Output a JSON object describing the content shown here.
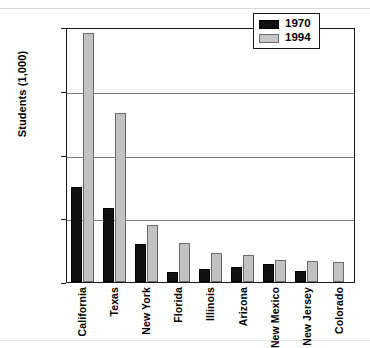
{
  "chart_data": {
    "type": "bar",
    "title": "",
    "xlabel": "",
    "ylabel": "Students (1,000)",
    "ylim": [
      0,
      2000
    ],
    "yticks": [
      "0",
      "500",
      "1,000",
      "1,500",
      "2,000"
    ],
    "ytick_values": [
      0,
      500,
      1000,
      1500,
      2000
    ],
    "grid": "horizontal",
    "legend_position": "top-right",
    "categories": [
      "California",
      "Texas",
      "New York",
      "Florida",
      "Illinois",
      "Arizona",
      "New Mexico",
      "New Jersey",
      "Colorado"
    ],
    "series": [
      {
        "name": "1970",
        "color": "#111111",
        "values": [
          745,
          580,
          300,
          80,
          100,
          115,
          140,
          85,
          0
        ]
      },
      {
        "name": "1994",
        "color": "#c2c2c2",
        "values": [
          1950,
          1325,
          450,
          305,
          225,
          210,
          175,
          165,
          155
        ]
      }
    ]
  },
  "legend": {
    "items": [
      {
        "label": "1970"
      },
      {
        "label": "1994"
      }
    ]
  },
  "axis": {
    "y_title": "Students (1,000)",
    "y_labels": [
      "2,000",
      "1,500",
      "1,000",
      "500",
      "0"
    ]
  }
}
